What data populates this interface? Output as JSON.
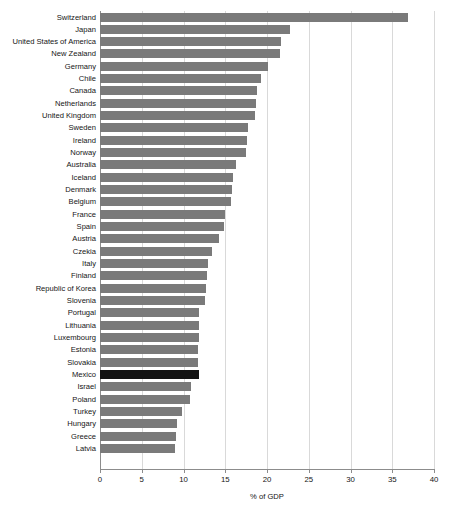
{
  "chart_data": {
    "type": "bar",
    "orientation": "horizontal",
    "title": "",
    "xlabel": "% of GDP",
    "ylabel": "",
    "xlim": [
      0,
      40
    ],
    "xticks": [
      0,
      5,
      10,
      15,
      20,
      25,
      30,
      35,
      40
    ],
    "grid": true,
    "legend": false,
    "bar_color": "#7a7a7a",
    "highlight_color": "#131313",
    "highlight_category": "Mexico",
    "categories": [
      "Switzerland",
      "Japan",
      "United States of America",
      "New Zealand",
      "Germany",
      "Chile",
      "Canada",
      "Netherlands",
      "United Kingdom",
      "Sweden",
      "Ireland",
      "Norway",
      "Australia",
      "Iceland",
      "Denmark",
      "Belgium",
      "France",
      "Spain",
      "Austria",
      "Czekia",
      "Italy",
      "Finland",
      "Republic of Korea",
      "Slovenia",
      "Portugal",
      "Lithuania",
      "Luxembourg",
      "Estonia",
      "Slovakia",
      "Mexico",
      "Israel",
      "Poland",
      "Turkey",
      "Hungary",
      "Greece",
      "Latvia"
    ],
    "values": [
      36.9,
      22.8,
      21.7,
      21.6,
      20.1,
      19.3,
      18.8,
      18.7,
      18.6,
      17.7,
      17.6,
      17.5,
      16.3,
      15.9,
      15.8,
      15.7,
      15.0,
      14.9,
      14.3,
      13.4,
      12.9,
      12.8,
      12.7,
      12.6,
      11.9,
      11.8,
      11.8,
      11.7,
      11.7,
      11.9,
      10.9,
      10.8,
      9.8,
      9.2,
      9.1,
      9.0
    ]
  }
}
